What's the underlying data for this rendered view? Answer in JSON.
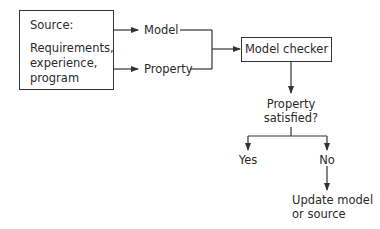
{
  "diagram": {
    "type": "flowchart",
    "source_box": {
      "title": "Source:",
      "lines": [
        "Requirements,",
        "experience,",
        "program"
      ]
    },
    "outputs": {
      "model": "Model",
      "property": "Property"
    },
    "checker": {
      "label": "Model checker"
    },
    "decision": {
      "lines": [
        "Property",
        "satisfied?"
      ]
    },
    "branches": {
      "yes": "Yes",
      "no": "No"
    },
    "action": {
      "lines": [
        "Update model",
        "or source"
      ]
    },
    "colors": {
      "line": "#333333",
      "text": "#2a2a2a",
      "background": "#ffffff"
    }
  }
}
